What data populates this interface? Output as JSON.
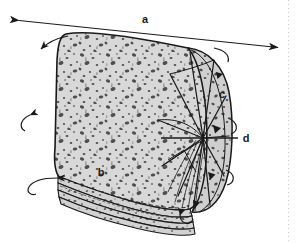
{
  "figure": {
    "background_color": "#ffffff",
    "ink_color": "#1a1a1a",
    "body_fill_color": "#d8d8d8",
    "speckle_color": "#4a4a4a",
    "shade_fill_color": "#c6c6c6"
  },
  "labels": [
    {
      "id": "a",
      "text": "a",
      "x": 145,
      "y": 20,
      "meaning": "core-length-dimension"
    },
    {
      "id": "b",
      "text": "b",
      "x": 101,
      "y": 173,
      "meaning": "bedding-layer-surface"
    },
    {
      "id": "c",
      "text": "c",
      "x": 222,
      "y": 95,
      "meaning": "core-end-margin"
    },
    {
      "id": "d",
      "text": "d",
      "x": 246,
      "y": 139,
      "meaning": "radial-centre-axis"
    }
  ],
  "annotations": {
    "dimension_arrow": {
      "name": "length-dimension-arrow",
      "style": "double-headed",
      "from": {
        "x": 18,
        "y": 20
      },
      "to": {
        "x": 279,
        "y": 48
      }
    },
    "leader_line_d": {
      "name": "leader-line-d",
      "from": {
        "x": 240,
        "y": 138
      },
      "to": {
        "x": 160,
        "y": 138
      }
    },
    "curved_arrows": [
      {
        "name": "curved-arrow-top-left",
        "direction": "counterclockwise"
      },
      {
        "name": "curved-arrow-mid-left",
        "direction": "counterclockwise"
      },
      {
        "name": "curved-arrow-bottom-left",
        "direction": "counterclockwise"
      },
      {
        "name": "curved-arrow-top-right",
        "direction": "clockwise"
      },
      {
        "name": "curved-arrow-mid-right",
        "direction": "clockwise"
      },
      {
        "name": "curved-arrow-bottom-right",
        "direction": "clockwise"
      }
    ],
    "solid_arrowheads": [
      {
        "name": "arrowhead-upper-right"
      },
      {
        "name": "arrowhead-centre-right"
      },
      {
        "name": "arrowhead-lower-right"
      },
      {
        "name": "arrowhead-bottom-right"
      }
    ],
    "margin_guide": {
      "name": "page-margin-dotted-line",
      "x": 288,
      "style": "dotted"
    }
  },
  "geometry": {
    "cylinder_body": {
      "name": "cylinder-body",
      "top_left": {
        "x": 66,
        "y": 34
      },
      "top_right": {
        "x": 205,
        "y": 52
      },
      "bottom_left": {
        "x": 58,
        "y": 176
      },
      "bottom_right": {
        "x": 196,
        "y": 210
      }
    },
    "end_cap": {
      "name": "cylinder-end-cap",
      "centre": {
        "x": 203,
        "y": 138
      },
      "radial_spokes": 9
    },
    "bedding_layers": {
      "name": "bedding-layer-stack",
      "count": 5
    }
  }
}
